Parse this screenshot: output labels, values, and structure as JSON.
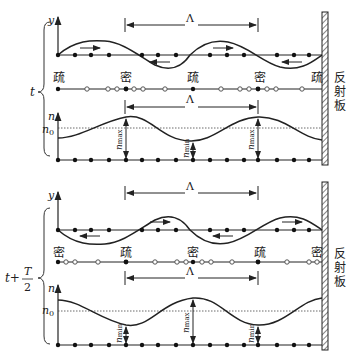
{
  "diagram": {
    "title": "",
    "reflector_label": [
      "反",
      "射",
      "板"
    ],
    "lambda_label": "Λ",
    "axis_y": "y",
    "axis_n": "n",
    "n0_label": "n",
    "n0_sub": "0",
    "n_max": "n",
    "n_max_sub": "max",
    "n_min": "n",
    "n_min_sub": "min",
    "time_top": "t",
    "time_bottom_prefix": "t+",
    "time_bottom_num": "T",
    "time_bottom_den": "2",
    "top_labels": [
      "疏",
      "密",
      "疏",
      "密",
      "疏"
    ],
    "bottom_labels": [
      "密",
      "疏",
      "密",
      "疏",
      "密"
    ]
  }
}
